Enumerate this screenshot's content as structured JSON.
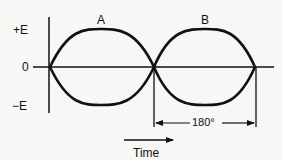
{
  "diagram": {
    "title": "",
    "y_labels": {
      "top": "+E",
      "zero": "0",
      "bottom": "−E"
    },
    "waves": [
      {
        "name": "A",
        "label": "A"
      },
      {
        "name": "B",
        "label": "B"
      }
    ],
    "phase_dimension": "180°",
    "time_label": "Time",
    "colors": {
      "line": "#111111",
      "background": "#f7f7f5"
    }
  }
}
